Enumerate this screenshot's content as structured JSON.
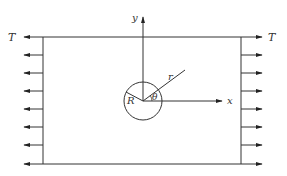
{
  "diagram": {
    "labels": {
      "tension_left": "T",
      "tension_right": "T",
      "y_axis": "y",
      "x_axis": "x",
      "radial_coord": "r",
      "hole_radius": "R",
      "angle": "θ"
    },
    "plate": {
      "left": 43,
      "right": 241,
      "top": 37,
      "bottom": 164
    },
    "hole": {
      "cx": 143,
      "cy": 101,
      "radius": 19
    },
    "arrow_rows_y": [
      37,
      55,
      73,
      91,
      109,
      127,
      145,
      164
    ],
    "colors": {
      "stroke": "#333333",
      "background": "#ffffff"
    }
  }
}
